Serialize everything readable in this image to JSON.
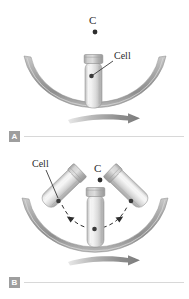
{
  "figure": {
    "background_color": "#ffffff",
    "band_color": "#9a9a9a",
    "band_highlight": "#d6d6d6",
    "tube_color": "#e3e3e3",
    "tube_edge": "#9b9b9b",
    "cap_color": "#b5b5b5",
    "cell_color": "#3a3a3a",
    "label_color": "#2b2b2b",
    "key_box_color": "#9e9e9e",
    "rule_color": "#d8d8d8"
  },
  "panels": [
    {
      "key": "A",
      "labels": {
        "center_of_rotation": "C",
        "cell": "Cell"
      },
      "rotation_arrow": "clockwise-arrow",
      "tube_count": 1,
      "tube_angles_deg": [
        0
      ]
    },
    {
      "key": "B",
      "labels": {
        "center_of_rotation": "C",
        "cell": "Cell"
      },
      "rotation_arrow": "clockwise-arrow",
      "tube_count": 3,
      "tube_angles_deg": [
        -42,
        0,
        42
      ],
      "trajectory": "dashed-arc-with-arrowheads"
    }
  ]
}
